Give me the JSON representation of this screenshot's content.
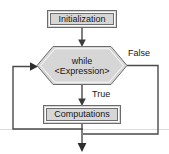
{
  "diagram": {
    "type": "flowchart",
    "canvas": {
      "width": 169,
      "height": 154,
      "background": "#ffffff"
    },
    "style": {
      "node_fill": "#d6d6d6",
      "node_border": "#5a5a5a",
      "node_inner_border": "#ffffff",
      "edge_color": "#4a4a4a",
      "text_color": "#161616",
      "faint_line_color": "#dcdcdc"
    },
    "nodes": [
      {
        "id": "initialization",
        "shape": "rectangle",
        "label": "Initialization",
        "x": 48,
        "y": 11,
        "width": 68,
        "height": 16
      },
      {
        "id": "while-condition",
        "shape": "hexagon",
        "label_line1": "while",
        "label_line2": "<Expression>",
        "x": 37,
        "y": 46,
        "width": 90,
        "height": 39
      },
      {
        "id": "computations",
        "shape": "rectangle",
        "label": "Computations",
        "x": 44,
        "y": 106,
        "width": 76,
        "height": 17
      }
    ],
    "edges": [
      {
        "id": "init-to-while",
        "from": "initialization",
        "to": "while-condition",
        "label": "",
        "arrow": true
      },
      {
        "id": "while-true-to-computations",
        "from": "while-condition",
        "to": "computations",
        "label": "True",
        "arrow": true
      },
      {
        "id": "while-false-to-exit",
        "from": "while-condition",
        "to": "exit",
        "label": "False",
        "arrow": true
      },
      {
        "id": "computations-back-to-while",
        "from": "computations",
        "to": "while-condition",
        "label": "",
        "arrow": true
      }
    ],
    "edge_labels": {
      "true": "True",
      "false": "False"
    }
  }
}
